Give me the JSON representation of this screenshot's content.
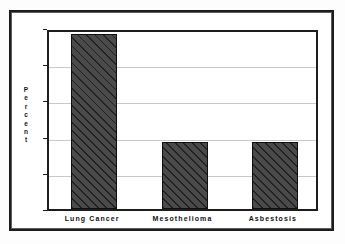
{
  "chart_data": {
    "type": "bar",
    "title": "",
    "subtitle": "",
    "xlabel": "",
    "ylabel": "Percent",
    "categories": [
      "Lung Cancer",
      "Mesothelioma",
      "Asbestosis"
    ],
    "values": [
      24.2,
      9.2,
      9.2
    ],
    "ylim": [
      0,
      25
    ],
    "yticks": [
      "0",
      "5",
      "10",
      "15",
      "20",
      "25"
    ],
    "ytick_values": [
      0,
      5,
      10,
      15,
      20,
      25
    ],
    "grid": "horizontal",
    "legend": "none",
    "bar_fill_color": "#4a4a4a",
    "bar_hatch": "diagonal-forward",
    "bar_edge_color": "#101010",
    "gridline_color": "#c9c9c9",
    "axis_color": "#1d1d1d",
    "frame_color": "#1c1c1c",
    "background_color": "#ffffff"
  },
  "ylabel_letters": [
    "P",
    "e",
    "r",
    "c",
    "e",
    "n",
    "t"
  ]
}
